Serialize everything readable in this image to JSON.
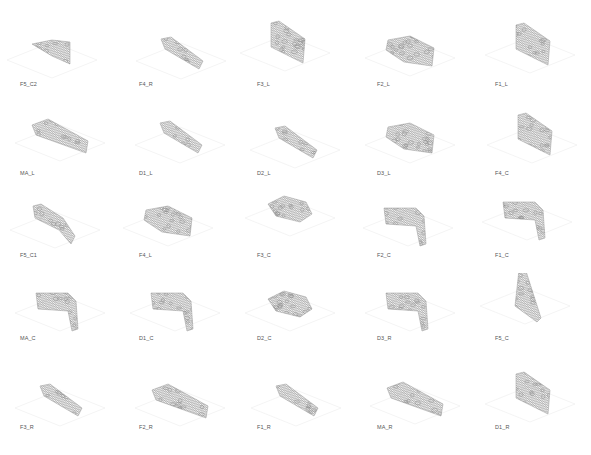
{
  "figure": {
    "rows": 5,
    "cols": 5,
    "line_color": "#8a8a8a",
    "ground_color": "#ececec",
    "panels": [
      {
        "label": "F5_C2",
        "row": 0,
        "col": 0,
        "cx": 52,
        "cy": 52,
        "shape": "wedge-left"
      },
      {
        "label": "F4_R",
        "row": 0,
        "col": 1,
        "cx": 181,
        "cy": 53,
        "shape": "slab-diag"
      },
      {
        "label": "F3_L",
        "row": 0,
        "col": 2,
        "cx": 285,
        "cy": 45,
        "shape": "block-tall"
      },
      {
        "label": "F2_L",
        "row": 0,
        "col": 3,
        "cx": 410,
        "cy": 50,
        "shape": "block-wide"
      },
      {
        "label": "F1_L",
        "row": 0,
        "col": 4,
        "cx": 530,
        "cy": 47,
        "shape": "block-tall"
      },
      {
        "label": "MA_L",
        "row": 1,
        "col": 0,
        "cx": 60,
        "cy": 135,
        "shape": "slab-long"
      },
      {
        "label": "D1_L",
        "row": 1,
        "col": 1,
        "cx": 180,
        "cy": 137,
        "shape": "slab-diag"
      },
      {
        "label": "D2_L",
        "row": 1,
        "col": 2,
        "cx": 295,
        "cy": 142,
        "shape": "slab-diag"
      },
      {
        "label": "D3_L",
        "row": 1,
        "col": 3,
        "cx": 410,
        "cy": 137,
        "shape": "block-wide"
      },
      {
        "label": "F4_C",
        "row": 1,
        "col": 4,
        "cx": 532,
        "cy": 137,
        "shape": "block-tall"
      },
      {
        "label": "F5_C1",
        "row": 2,
        "col": 0,
        "cx": 55,
        "cy": 222,
        "shape": "arc"
      },
      {
        "label": "F4_L",
        "row": 2,
        "col": 1,
        "cx": 168,
        "cy": 220,
        "shape": "block-wide"
      },
      {
        "label": "F3_C",
        "row": 2,
        "col": 2,
        "cx": 290,
        "cy": 210,
        "shape": "cluster"
      },
      {
        "label": "F2_C",
        "row": 2,
        "col": 3,
        "cx": 408,
        "cy": 220,
        "shape": "corner"
      },
      {
        "label": "F1_C",
        "row": 2,
        "col": 4,
        "cx": 527,
        "cy": 214,
        "shape": "corner"
      },
      {
        "label": "MA_C",
        "row": 3,
        "col": 0,
        "cx": 60,
        "cy": 305,
        "shape": "corner"
      },
      {
        "label": "D1_C",
        "row": 3,
        "col": 1,
        "cx": 175,
        "cy": 305,
        "shape": "corner"
      },
      {
        "label": "D2_C",
        "row": 3,
        "col": 2,
        "cx": 290,
        "cy": 305,
        "shape": "cluster"
      },
      {
        "label": "D3_R",
        "row": 3,
        "col": 3,
        "cx": 410,
        "cy": 305,
        "shape": "corner"
      },
      {
        "label": "F5_C",
        "row": 3,
        "col": 4,
        "cx": 525,
        "cy": 298,
        "shape": "wedge-tall"
      },
      {
        "label": "F3_R",
        "row": 4,
        "col": 0,
        "cx": 60,
        "cy": 400,
        "shape": "slab-diag"
      },
      {
        "label": "F2_R",
        "row": 4,
        "col": 1,
        "cx": 180,
        "cy": 400,
        "shape": "slab-long"
      },
      {
        "label": "F1_R",
        "row": 4,
        "col": 2,
        "cx": 296,
        "cy": 400,
        "shape": "slab-diag"
      },
      {
        "label": "MA_R",
        "row": 4,
        "col": 3,
        "cx": 415,
        "cy": 398,
        "shape": "slab-long"
      },
      {
        "label": "D1_R",
        "row": 4,
        "col": 4,
        "cx": 530,
        "cy": 396,
        "shape": "block-tall"
      }
    ],
    "caption_positions": {
      "col_x": [
        20,
        139,
        257,
        377,
        495
      ],
      "row_y": [
        81,
        170,
        252,
        335,
        424
      ]
    }
  }
}
